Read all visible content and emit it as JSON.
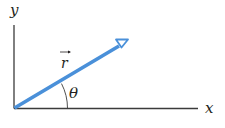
{
  "diagram": {
    "axis_x_label": "x",
    "axis_y_label": "y",
    "vector_label": "r",
    "angle_label": "θ",
    "colors": {
      "axes": "#3b3b3b",
      "vector": "#4a90d9",
      "text": "#231f20"
    }
  }
}
